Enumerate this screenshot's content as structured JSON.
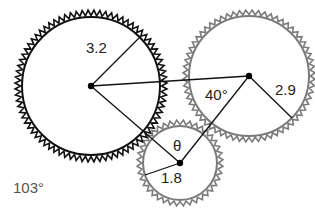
{
  "diagram": {
    "type": "gear-train",
    "gears": [
      {
        "id": "large",
        "radius_label": "3.2",
        "cx": 91,
        "cy": 86,
        "r_inner": 69,
        "r_outer": 76,
        "teeth": 80,
        "color": "#111111",
        "stroke_width": 2
      },
      {
        "id": "right",
        "radius_label": "2.9",
        "cx": 249,
        "cy": 76,
        "r_inner": 60,
        "r_outer": 66,
        "teeth": 64,
        "color": "#7a7a7a",
        "stroke_width": 2
      },
      {
        "id": "small",
        "radius_label": "1.8",
        "cx": 180,
        "cy": 163,
        "r_inner": 37,
        "r_outer": 43,
        "teeth": 40,
        "color": "#7a7a7a",
        "stroke_width": 2
      }
    ],
    "labels": {
      "large_radius": "3.2",
      "right_radius": "2.9",
      "small_radius": "1.8",
      "right_angle": "40°",
      "small_angle": "θ",
      "corner_angle": "103°"
    },
    "line_color": "#111111"
  }
}
